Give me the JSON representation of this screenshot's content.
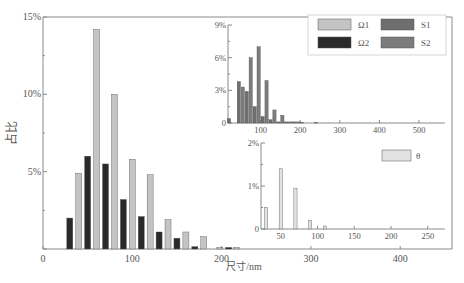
{
  "colors": {
    "omega1": "#c4c4c4",
    "omega2": "#2a2a2a",
    "s1": "#6e6e6e",
    "s2": "#7c7c7c",
    "theta": "#e2e2e2",
    "axis": "#8a8a8a",
    "edge": "#555555"
  },
  "chart_data": [
    {
      "id": "main",
      "type": "bar",
      "title": "",
      "xlabel": "尺寸/nm",
      "ylabel": "占比",
      "xlim": [
        0,
        460
      ],
      "ylim": [
        0,
        15
      ],
      "xticks": [
        0,
        100,
        200,
        300,
        400
      ],
      "yticks": [
        {
          "v": 0,
          "label": ""
        },
        {
          "v": 5,
          "label": "5%"
        },
        {
          "v": 10,
          "label": "10%"
        },
        {
          "v": 15,
          "label": "15%"
        }
      ],
      "series": [
        {
          "name": "Ω1",
          "color_key": "omega1",
          "x": [
            40,
            60,
            80,
            100,
            120,
            140,
            160,
            180,
            198,
            217
          ],
          "values": [
            4.9,
            14.2,
            10.0,
            5.8,
            4.8,
            1.9,
            1.1,
            0.8,
            0.1,
            0.1
          ]
        },
        {
          "name": "Ω2",
          "color_key": "omega2",
          "x": [
            30,
            50,
            70,
            90,
            110,
            130,
            150,
            170,
            208
          ],
          "values": [
            2.0,
            6.0,
            5.5,
            3.2,
            2.1,
            1.1,
            0.7,
            0.15,
            0.1
          ]
        }
      ]
    },
    {
      "id": "inset_top",
      "type": "bar",
      "xlabel": "",
      "ylabel": "",
      "xlim": [
        0,
        550
      ],
      "ylim": [
        0,
        9
      ],
      "xticks": [
        100,
        200,
        300,
        400,
        500
      ],
      "yticks": [
        {
          "v": 0,
          "label": "0"
        },
        {
          "v": 3,
          "label": "3%"
        },
        {
          "v": 6,
          "label": "6%"
        },
        {
          "v": 9,
          "label": "9%"
        }
      ],
      "legend": [
        {
          "name": "Ω1",
          "color_key": "omega1"
        },
        {
          "name": "S1",
          "color_key": "s1"
        },
        {
          "name": "Ω2",
          "color_key": "omega2"
        },
        {
          "name": "S2",
          "color_key": "s2"
        }
      ],
      "series": [
        {
          "name": "S1",
          "color_key": "s1",
          "x": [
            20,
            45,
            65,
            85,
            105,
            125,
            145,
            165,
            185,
            205
          ],
          "values": [
            0.4,
            3.8,
            2.9,
            1.5,
            0.6,
            0.3,
            0.1,
            0.1,
            0.1,
            0.05
          ]
        },
        {
          "name": "S2",
          "color_key": "s2",
          "x": [
            55,
            75,
            95,
            115,
            135,
            155,
            175,
            195,
            240
          ],
          "values": [
            3.3,
            6.0,
            7.0,
            3.9,
            1.2,
            0.7,
            0.1,
            0.1,
            0.05
          ]
        }
      ]
    },
    {
      "id": "inset_bottom",
      "type": "bar",
      "xlabel": "",
      "ylabel": "",
      "xlim": [
        0,
        270
      ],
      "ylim": [
        0,
        2
      ],
      "xticks": [
        50,
        100,
        150,
        200,
        250
      ],
      "yticks": [
        {
          "v": 0,
          "label": "0"
        },
        {
          "v": 1,
          "label": "1%"
        },
        {
          "v": 2,
          "label": "2%"
        }
      ],
      "legend": [
        {
          "name": "θ",
          "color_key": "theta"
        }
      ],
      "series": [
        {
          "name": "θ",
          "color_key": "theta",
          "x": [
            30,
            50,
            70,
            90,
            110
          ],
          "values": [
            0.5,
            1.4,
            0.95,
            0.2,
            0.07
          ]
        }
      ]
    }
  ]
}
